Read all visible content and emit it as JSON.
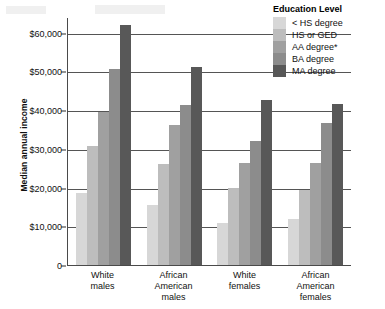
{
  "chart_data": {
    "type": "bar",
    "title": "",
    "xlabel": "",
    "ylabel": "Median annual income",
    "ylim": [
      0,
      64000
    ],
    "grid": true,
    "legend_position": "top-right",
    "legend_title": "Education Level",
    "categories": [
      "White males",
      "African American males",
      "White females",
      "African American females"
    ],
    "category_lines": [
      [
        "White",
        "males"
      ],
      [
        "African",
        "American",
        "males"
      ],
      [
        "White",
        "females"
      ],
      [
        "African",
        "American",
        "females"
      ]
    ],
    "ytick_labels": [
      "$60,000",
      "$50,000",
      "$40,000",
      "$30,000",
      "$20,000",
      "$10,000",
      "0"
    ],
    "ytick_values": [
      60000,
      50000,
      40000,
      30000,
      20000,
      10000,
      0
    ],
    "series": [
      {
        "name": "< HS degree",
        "color": "#d7d7d7",
        "values": [
          18500,
          15400,
          10900,
          12000
        ]
      },
      {
        "name": "HS or GED",
        "color": "#bdbdbd",
        "values": [
          30700,
          26000,
          20000,
          19400
        ]
      },
      {
        "name": "AA degree*",
        "color": "#a0a0a0",
        "values": [
          39500,
          36100,
          26400,
          26400
        ]
      },
      {
        "name": "BA degree",
        "color": "#8c8c8c",
        "values": [
          50700,
          41300,
          32000,
          36700
        ]
      },
      {
        "name": "MA degree",
        "color": "#585858",
        "values": [
          62000,
          51200,
          42500,
          41500
        ]
      }
    ]
  }
}
